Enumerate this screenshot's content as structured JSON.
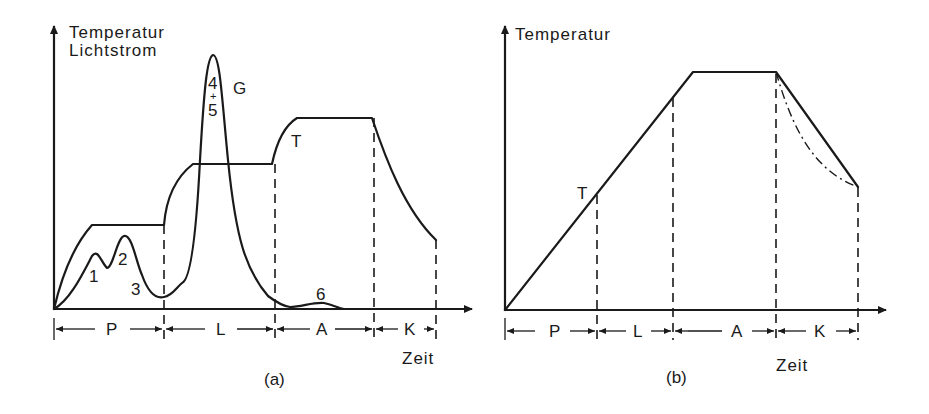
{
  "panel_a": {
    "caption": "(a)",
    "y_axis_label_line1": "Temperatur",
    "y_axis_label_line2": "Lichtstrom",
    "x_axis_label": "Zeit",
    "curve_labels": {
      "temperature": "T",
      "luminous_flux": "G",
      "peak1": "1",
      "peak2": "2",
      "valley3": "3",
      "peak4": "4",
      "plus": "+",
      "peak5": "5",
      "bump6": "6"
    },
    "phases": [
      "P",
      "L",
      "A",
      "K"
    ]
  },
  "panel_b": {
    "caption": "(b)",
    "y_axis_label": "Temperatur",
    "x_axis_label": "Zeit",
    "curve_labels": {
      "temperature": "T"
    },
    "phases": [
      "P",
      "L",
      "A",
      "K"
    ]
  }
}
